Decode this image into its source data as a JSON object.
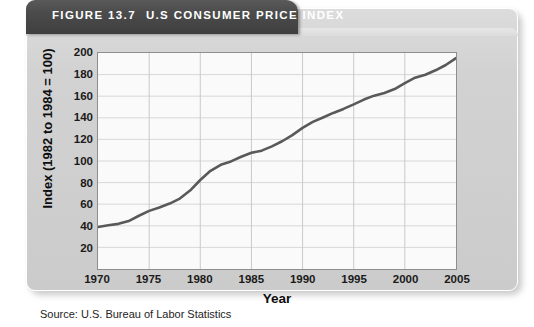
{
  "figure": {
    "label": "FIGURE 13.7",
    "title": "U.S CONSUMER PRICE INDEX",
    "source": "Source: U.S. Bureau of Labor Statistics"
  },
  "colors": {
    "header_bg": "#4c4c4c",
    "header_text": "#ffffff",
    "panel_bg": "#d2d2d2",
    "plot_bg": "#fafafa",
    "grid": "#d8d8d8",
    "axis": "#8e8e8e",
    "line": "#595959"
  },
  "chart_data": {
    "type": "line",
    "title": "U.S CONSUMER PRICE INDEX",
    "xlabel": "Year",
    "ylabel": "Index (1982 to 1984 = 100)",
    "xlim": [
      1970,
      2005
    ],
    "ylim": [
      0,
      200
    ],
    "xticks": [
      1970,
      1975,
      1980,
      1985,
      1990,
      1995,
      2000,
      2005
    ],
    "yticks": [
      20,
      40,
      60,
      80,
      100,
      120,
      140,
      160,
      180,
      200
    ],
    "grid": true,
    "legend": "none",
    "series": [
      {
        "name": "Consumer Price Index",
        "color": "#595959",
        "x": [
          1970,
          1971,
          1972,
          1973,
          1974,
          1975,
          1976,
          1977,
          1978,
          1979,
          1980,
          1981,
          1982,
          1983,
          1984,
          1985,
          1986,
          1987,
          1988,
          1989,
          1990,
          1991,
          1992,
          1993,
          1994,
          1995,
          1996,
          1997,
          1998,
          1999,
          2000,
          2001,
          2002,
          2003,
          2004,
          2005
        ],
        "values": [
          38.8,
          40.5,
          41.8,
          44.4,
          49.3,
          53.8,
          56.9,
          60.6,
          65.2,
          72.6,
          82.4,
          90.9,
          96.5,
          99.6,
          103.9,
          107.6,
          109.6,
          113.6,
          118.3,
          124.0,
          130.7,
          136.2,
          140.3,
          144.5,
          148.2,
          152.4,
          156.9,
          160.5,
          163.0,
          166.6,
          172.2,
          177.1,
          179.9,
          184.0,
          188.9,
          195.3
        ]
      }
    ]
  }
}
